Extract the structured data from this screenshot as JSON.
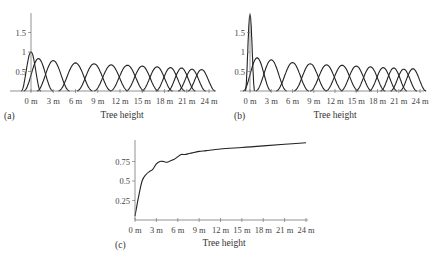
{
  "chart_data": [
    {
      "panel": "(a)",
      "type": "line",
      "xlabel": "Tree height",
      "ylabel": "",
      "x_ticks": [
        "0 m",
        "3 m",
        "6 m",
        "9 m",
        "12 m",
        "15 m",
        "18 m",
        "21 m",
        "24 m"
      ],
      "y_ticks": [
        "0.5",
        "1",
        "1.5"
      ],
      "xlim": [
        0,
        24
      ],
      "ylim": [
        0,
        2
      ],
      "grid": false,
      "description": "Family of bell-shaped (Gaussian-like) membership curves along tree height",
      "series": [
        {
          "name": "curve 1",
          "center": 0,
          "peak": 1.0,
          "width": 0.6
        },
        {
          "name": "curve 2",
          "center": 1,
          "peak": 0.83,
          "width": 0.9
        },
        {
          "name": "curve 3",
          "center": 3,
          "peak": 0.78,
          "width": 1.0
        },
        {
          "name": "curve 4",
          "center": 6,
          "peak": 0.72,
          "width": 1.05
        },
        {
          "name": "curve 5",
          "center": 8.5,
          "peak": 0.7,
          "width": 1.05
        },
        {
          "name": "curve 6",
          "center": 10.8,
          "peak": 0.67,
          "width": 1.05
        },
        {
          "name": "curve 7",
          "center": 13,
          "peak": 0.66,
          "width": 1.05
        },
        {
          "name": "curve 8",
          "center": 15,
          "peak": 0.64,
          "width": 1.0
        },
        {
          "name": "curve 9",
          "center": 17,
          "peak": 0.62,
          "width": 0.95
        },
        {
          "name": "curve 10",
          "center": 18.8,
          "peak": 0.6,
          "width": 0.9
        },
        {
          "name": "curve 11",
          "center": 20.3,
          "peak": 0.59,
          "width": 0.85
        },
        {
          "name": "curve 12",
          "center": 21.7,
          "peak": 0.56,
          "width": 0.85
        },
        {
          "name": "curve 13",
          "center": 23,
          "peak": 0.55,
          "width": 0.85
        }
      ]
    },
    {
      "panel": "(b)",
      "type": "line",
      "xlabel": "Tree height",
      "ylabel": "",
      "x_ticks": [
        "0 m",
        "3 m",
        "6 m",
        "9 m",
        "12 m",
        "15 m",
        "18 m",
        "21 m",
        "24 m"
      ],
      "y_ticks": [
        "0.5",
        "1",
        "1.5"
      ],
      "xlim": [
        0,
        24
      ],
      "ylim": [
        0,
        2
      ],
      "grid": false,
      "description": "Same family of curves; first curve sharply peaked near 0 m reaching ~1.95",
      "series": [
        {
          "name": "curve 1",
          "center": 0,
          "peak": 1.95,
          "width": 0.3
        },
        {
          "name": "curve 2",
          "center": 1,
          "peak": 0.85,
          "width": 0.9
        },
        {
          "name": "curve 3",
          "center": 3,
          "peak": 0.8,
          "width": 1.0
        },
        {
          "name": "curve 4",
          "center": 6,
          "peak": 0.73,
          "width": 1.05
        },
        {
          "name": "curve 5",
          "center": 8.5,
          "peak": 0.7,
          "width": 1.05
        },
        {
          "name": "curve 6",
          "center": 10.8,
          "peak": 0.67,
          "width": 1.05
        },
        {
          "name": "curve 7",
          "center": 13,
          "peak": 0.66,
          "width": 1.05
        },
        {
          "name": "curve 8",
          "center": 15,
          "peak": 0.64,
          "width": 1.0
        },
        {
          "name": "curve 9",
          "center": 17,
          "peak": 0.62,
          "width": 0.95
        },
        {
          "name": "curve 10",
          "center": 18.8,
          "peak": 0.6,
          "width": 0.9
        },
        {
          "name": "curve 11",
          "center": 20.3,
          "peak": 0.59,
          "width": 0.85
        },
        {
          "name": "curve 12",
          "center": 21.7,
          "peak": 0.56,
          "width": 0.85
        },
        {
          "name": "curve 13",
          "center": 23,
          "peak": 0.57,
          "width": 0.85
        }
      ]
    },
    {
      "panel": "(c)",
      "type": "line",
      "xlabel": "Tree height",
      "ylabel": "",
      "x_ticks": [
        "0 m",
        "3 m",
        "6 m",
        "9 m",
        "12 m",
        "15 m",
        "18 m",
        "21 m",
        "24 m"
      ],
      "y_ticks": [
        "0.25",
        "0.5",
        "0.75"
      ],
      "xlim": [
        0,
        24
      ],
      "ylim": [
        0,
        1.0
      ],
      "grid": false,
      "series": [
        {
          "name": "cumulative curve",
          "x": [
            0,
            0.5,
            1,
            1.5,
            2,
            2.5,
            3,
            3.5,
            4,
            4.5,
            5,
            5.5,
            6,
            6.5,
            7,
            7.5,
            8,
            9,
            10,
            12,
            15,
            18,
            21,
            24
          ],
          "y": [
            0.05,
            0.3,
            0.5,
            0.58,
            0.62,
            0.65,
            0.72,
            0.75,
            0.75,
            0.74,
            0.76,
            0.78,
            0.81,
            0.84,
            0.84,
            0.85,
            0.86,
            0.88,
            0.89,
            0.91,
            0.93,
            0.95,
            0.97,
            0.99
          ]
        }
      ]
    }
  ],
  "panels": {
    "a": {
      "label": "(a)",
      "xlabel": "Tree height",
      "x_ticks": [
        "0 m",
        "3 m",
        "6 m",
        "9 m",
        "12 m",
        "15 m",
        "18 m",
        "21 m",
        "24 m"
      ],
      "y_ticks": [
        "0.5",
        "1",
        "1.5"
      ]
    },
    "b": {
      "label": "(b)",
      "xlabel": "Tree height",
      "x_ticks": [
        "0 m",
        "3 m",
        "6 m",
        "9 m",
        "12 m",
        "15 m",
        "18 m",
        "21 m",
        "24 m"
      ],
      "y_ticks": [
        "0.5",
        "1",
        "1.5"
      ]
    },
    "c": {
      "label": "(c)",
      "xlabel": "Tree height",
      "x_ticks": [
        "0 m",
        "3 m",
        "6 m",
        "9 m",
        "12 m",
        "15 m",
        "18 m",
        "21 m",
        "24 m"
      ],
      "y_ticks": [
        "0.25",
        "0.5",
        "0.75"
      ]
    }
  },
  "colors": {
    "line": "#222222",
    "axis": "#777777",
    "text": "#444444"
  }
}
